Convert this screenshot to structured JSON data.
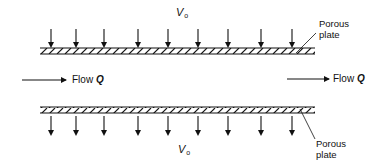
{
  "diagram": {
    "title": "",
    "top_velocity": {
      "symbol": "V",
      "subscript": "o"
    },
    "bottom_velocity": {
      "symbol": "V",
      "subscript": "o"
    },
    "top_plate_label": [
      "Porous",
      "plate"
    ],
    "bottom_plate_label": [
      "Porous",
      "plate"
    ],
    "flow_left": {
      "text": "Flow ",
      "symbol": "Q"
    },
    "flow_right": {
      "text": "Flow ",
      "symbol": "Q"
    },
    "arrow_x_positions": [
      51,
      76,
      104,
      138,
      168,
      198,
      228,
      261,
      292
    ],
    "colors": {
      "ink": "#111111",
      "background": "#ffffff"
    }
  }
}
